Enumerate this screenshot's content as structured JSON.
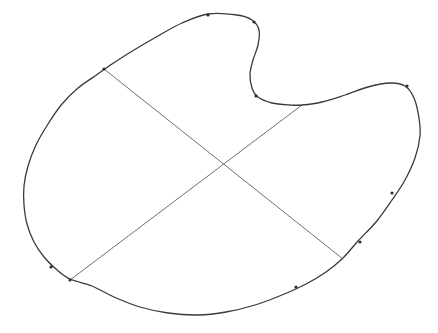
{
  "figure": {
    "background_color": "#ffffff",
    "outline_color": "#3a3a3a",
    "outline_width": 1.3,
    "chord_color": "#5f5f5f",
    "chord_width": 0.9,
    "node_color": "#2e2e2e",
    "node_radius": 1.6
  },
  "chart_data": {
    "type": "scatter",
    "xlabel": "",
    "ylabel": "",
    "xlim": [
      0,
      438
    ],
    "ylim": [
      0,
      333
    ],
    "grid": false,
    "legend": "none",
    "outline_points": [
      [
        208,
        14
      ],
      [
        237,
        15
      ],
      [
        252,
        20
      ],
      [
        259,
        30
      ],
      [
        258,
        45
      ],
      [
        253,
        60
      ],
      [
        250,
        74
      ],
      [
        252,
        88
      ],
      [
        258,
        97
      ],
      [
        272,
        103
      ],
      [
        290,
        105
      ],
      [
        302,
        105
      ],
      [
        322,
        102
      ],
      [
        345,
        95
      ],
      [
        368,
        87
      ],
      [
        390,
        83
      ],
      [
        405,
        86
      ],
      [
        414,
        98
      ],
      [
        419,
        118
      ],
      [
        420,
        136
      ],
      [
        415,
        158
      ],
      [
        405,
        180
      ],
      [
        392,
        200
      ],
      [
        376,
        222
      ],
      [
        358,
        241
      ],
      [
        343,
        258
      ],
      [
        326,
        272
      ],
      [
        306,
        284
      ],
      [
        282,
        295
      ],
      [
        255,
        305
      ],
      [
        226,
        312
      ],
      [
        198,
        315
      ],
      [
        168,
        313
      ],
      [
        140,
        307
      ],
      [
        114,
        297
      ],
      [
        92,
        286
      ],
      [
        70,
        279
      ],
      [
        56,
        269
      ],
      [
        44,
        257
      ],
      [
        34,
        242
      ],
      [
        27,
        224
      ],
      [
        24,
        205
      ],
      [
        24,
        186
      ],
      [
        28,
        166
      ],
      [
        36,
        145
      ],
      [
        48,
        124
      ],
      [
        62,
        104
      ],
      [
        78,
        88
      ],
      [
        95,
        76
      ],
      [
        112,
        64
      ],
      [
        134,
        50
      ],
      [
        158,
        36
      ],
      [
        182,
        23
      ],
      [
        208,
        14
      ]
    ],
    "chords": [
      {
        "name": "chord-nw-se",
        "start": [
          104,
          69
        ],
        "end": [
          343,
          259
        ]
      },
      {
        "name": "chord-sw-ne",
        "start": [
          70,
          280
        ],
        "end": [
          302,
          105
        ]
      }
    ],
    "intersection": [
      222,
      163
    ],
    "node_markers": [
      [
        208,
        15
      ],
      [
        104,
        69
      ],
      [
        254,
        22
      ],
      [
        256,
        96
      ],
      [
        407,
        86
      ],
      [
        392,
        193
      ],
      [
        360,
        242
      ],
      [
        296,
        287
      ],
      [
        51,
        267
      ],
      [
        70,
        280
      ]
    ]
  }
}
